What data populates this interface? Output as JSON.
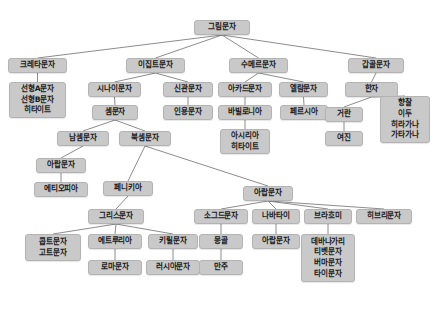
{
  "diagram": {
    "type": "tree",
    "colors": {
      "background": "#ffffff",
      "node_fill": "#c9c9c9",
      "node_border": "#b3b3b3",
      "edge": "#8c8c8c",
      "text": "#1a1a1a"
    },
    "nodes": [
      {
        "id": "n0",
        "label": "그림문자",
        "lines": [
          "그림문자"
        ],
        "x": 194,
        "y": 20,
        "w": 56,
        "h": 15
      },
      {
        "id": "n1",
        "label": "크레타문자",
        "lines": [
          "크레타문자"
        ],
        "x": 8,
        "y": 58,
        "w": 59,
        "h": 15
      },
      {
        "id": "n2",
        "label": "이집트문자",
        "lines": [
          "이집트문자"
        ],
        "x": 126,
        "y": 58,
        "w": 59,
        "h": 15
      },
      {
        "id": "n3",
        "label": "수메르문자",
        "lines": [
          "수메르문자"
        ],
        "x": 229,
        "y": 58,
        "w": 59,
        "h": 15
      },
      {
        "id": "n4",
        "label": "갑골문자",
        "lines": [
          "갑골문자"
        ],
        "x": 348,
        "y": 58,
        "w": 56,
        "h": 15
      },
      {
        "id": "n5",
        "label": "선형A문자 / 선형B문자 / 히타이트",
        "lines": [
          "선형A문자",
          "선형B문자",
          "히타이트"
        ],
        "x": 9,
        "y": 82,
        "w": 57,
        "h": 36
      },
      {
        "id": "n6",
        "label": "시나이문자",
        "lines": [
          "시나이문자"
        ],
        "x": 88,
        "y": 82,
        "w": 53,
        "h": 15
      },
      {
        "id": "n7",
        "label": "신관문자",
        "lines": [
          "신관문자"
        ],
        "x": 163,
        "y": 82,
        "w": 50,
        "h": 15
      },
      {
        "id": "n8",
        "label": "아카드문자",
        "lines": [
          "아카드문자"
        ],
        "x": 218,
        "y": 82,
        "w": 54,
        "h": 15
      },
      {
        "id": "n9",
        "label": "엘람문자",
        "lines": [
          "엘람문자"
        ],
        "x": 279,
        "y": 82,
        "w": 49,
        "h": 15
      },
      {
        "id": "n10",
        "label": "한자",
        "lines": [
          "한자"
        ],
        "x": 345,
        "y": 82,
        "w": 53,
        "h": 15
      },
      {
        "id": "n11",
        "label": "셈문자",
        "lines": [
          "셈문자"
        ],
        "x": 92,
        "y": 105,
        "w": 46,
        "h": 15
      },
      {
        "id": "n12",
        "label": "인용문자",
        "lines": [
          "인용문자"
        ],
        "x": 163,
        "y": 105,
        "w": 50,
        "h": 15
      },
      {
        "id": "n13",
        "label": "바빌로니아",
        "lines": [
          "바빌로니아"
        ],
        "x": 218,
        "y": 105,
        "w": 54,
        "h": 15
      },
      {
        "id": "n14",
        "label": "페르시아",
        "lines": [
          "페르시아"
        ],
        "x": 280,
        "y": 105,
        "w": 48,
        "h": 15
      },
      {
        "id": "n15",
        "label": "거란",
        "lines": [
          "거란"
        ],
        "x": 325,
        "y": 107,
        "w": 38,
        "h": 15
      },
      {
        "id": "n16",
        "label": "향찰 / 이두 / 히라가나 / 가타가나",
        "lines": [
          "향찰",
          "이두",
          "히라가나",
          "가타가나"
        ],
        "x": 380,
        "y": 96,
        "w": 50,
        "h": 47
      },
      {
        "id": "n17",
        "label": "여진",
        "lines": [
          "여진"
        ],
        "x": 325,
        "y": 131,
        "w": 38,
        "h": 15
      },
      {
        "id": "n18",
        "label": "아시리아 / 히타이트",
        "lines": [
          "아시리아",
          "히타이트"
        ],
        "x": 220,
        "y": 129,
        "w": 50,
        "h": 25
      },
      {
        "id": "n19",
        "label": "남셈문자",
        "lines": [
          "남셈문자"
        ],
        "x": 57,
        "y": 131,
        "w": 52,
        "h": 15
      },
      {
        "id": "n20",
        "label": "북셈문자",
        "lines": [
          "북셈문자"
        ],
        "x": 119,
        "y": 131,
        "w": 52,
        "h": 15
      },
      {
        "id": "n21",
        "label": "아랍문자",
        "lines": [
          "아랍문자"
        ],
        "x": 36,
        "y": 158,
        "w": 50,
        "h": 15
      },
      {
        "id": "n22",
        "label": "페니키아",
        "lines": [
          "페니키아"
        ],
        "x": 103,
        "y": 181,
        "w": 50,
        "h": 15
      },
      {
        "id": "n23",
        "label": "에티오피아",
        "lines": [
          "에티오피아"
        ],
        "x": 34,
        "y": 182,
        "w": 54,
        "h": 15
      },
      {
        "id": "n24",
        "label": "아랍문자",
        "lines": [
          "아랍문자"
        ],
        "x": 243,
        "y": 186,
        "w": 50,
        "h": 15
      },
      {
        "id": "n25",
        "label": "그리스문자",
        "lines": [
          "그리스문자"
        ],
        "x": 88,
        "y": 209,
        "w": 56,
        "h": 15
      },
      {
        "id": "n26",
        "label": "소그드문자",
        "lines": [
          "소그드문자"
        ],
        "x": 194,
        "y": 209,
        "w": 54,
        "h": 15
      },
      {
        "id": "n27",
        "label": "나바타이",
        "lines": [
          "나바타이"
        ],
        "x": 252,
        "y": 209,
        "w": 48,
        "h": 15
      },
      {
        "id": "n28",
        "label": "브라흐미",
        "lines": [
          "브라흐미"
        ],
        "x": 304,
        "y": 209,
        "w": 48,
        "h": 15
      },
      {
        "id": "n29",
        "label": "히브리문자",
        "lines": [
          "히브리문자"
        ],
        "x": 356,
        "y": 209,
        "w": 56,
        "h": 15
      },
      {
        "id": "n30",
        "label": "콩트문자 / 고트문자",
        "lines": [
          "콥트문자",
          "고트문자"
        ],
        "x": 25,
        "y": 234,
        "w": 56,
        "h": 27
      },
      {
        "id": "n31",
        "label": "에트루리아",
        "lines": [
          "에트루리아"
        ],
        "x": 88,
        "y": 234,
        "w": 54,
        "h": 15
      },
      {
        "id": "n32",
        "label": "키릴문자",
        "lines": [
          "키릴문자"
        ],
        "x": 148,
        "y": 234,
        "w": 50,
        "h": 15
      },
      {
        "id": "n33",
        "label": "몽골",
        "lines": [
          "몽골"
        ],
        "x": 199,
        "y": 234,
        "w": 44,
        "h": 15
      },
      {
        "id": "n34",
        "label": "아랍문자",
        "lines": [
          "아랍문자"
        ],
        "x": 252,
        "y": 234,
        "w": 48,
        "h": 15
      },
      {
        "id": "n35",
        "label": "데바나가리 / 티벳문자 / 버마문자 / 타이문자",
        "lines": [
          "데바나가리",
          "티벳문자",
          "버마문자",
          "타이문자"
        ],
        "x": 301,
        "y": 234,
        "w": 54,
        "h": 48
      },
      {
        "id": "n36",
        "label": "로마문자",
        "lines": [
          "로마문자"
        ],
        "x": 88,
        "y": 260,
        "w": 54,
        "h": 15
      },
      {
        "id": "n37",
        "label": "러시아문자",
        "lines": [
          "러시아문자"
        ],
        "x": 146,
        "y": 260,
        "w": 54,
        "h": 15
      },
      {
        "id": "n38",
        "label": "만주",
        "lines": [
          "만주"
        ],
        "x": 199,
        "y": 260,
        "w": 44,
        "h": 15
      }
    ],
    "edges": [
      {
        "from": "n0",
        "to": "n1"
      },
      {
        "from": "n0",
        "to": "n2"
      },
      {
        "from": "n0",
        "to": "n3"
      },
      {
        "from": "n0",
        "to": "n4"
      },
      {
        "from": "n1",
        "to": "n5"
      },
      {
        "from": "n2",
        "to": "n6"
      },
      {
        "from": "n2",
        "to": "n7"
      },
      {
        "from": "n3",
        "to": "n8"
      },
      {
        "from": "n3",
        "to": "n9"
      },
      {
        "from": "n4",
        "to": "n10"
      },
      {
        "from": "n6",
        "to": "n11"
      },
      {
        "from": "n7",
        "to": "n12"
      },
      {
        "from": "n8",
        "to": "n13"
      },
      {
        "from": "n9",
        "to": "n14"
      },
      {
        "from": "n10",
        "to": "n15"
      },
      {
        "from": "n10",
        "to": "n16"
      },
      {
        "from": "n15",
        "to": "n17"
      },
      {
        "from": "n13",
        "to": "n18"
      },
      {
        "from": "n11",
        "to": "n19"
      },
      {
        "from": "n11",
        "to": "n20"
      },
      {
        "from": "n19",
        "to": "n21"
      },
      {
        "from": "n21",
        "to": "n23"
      },
      {
        "from": "n20",
        "to": "n22"
      },
      {
        "from": "n20",
        "to": "n24"
      },
      {
        "from": "n22",
        "to": "n25"
      },
      {
        "from": "n25",
        "to": "n30"
      },
      {
        "from": "n25",
        "to": "n31"
      },
      {
        "from": "n25",
        "to": "n32"
      },
      {
        "from": "n31",
        "to": "n36"
      },
      {
        "from": "n32",
        "to": "n37"
      },
      {
        "from": "n24",
        "to": "n26"
      },
      {
        "from": "n24",
        "to": "n27"
      },
      {
        "from": "n24",
        "to": "n28"
      },
      {
        "from": "n24",
        "to": "n29"
      },
      {
        "from": "n26",
        "to": "n33"
      },
      {
        "from": "n33",
        "to": "n38"
      },
      {
        "from": "n27",
        "to": "n34"
      },
      {
        "from": "n28",
        "to": "n35"
      }
    ]
  }
}
